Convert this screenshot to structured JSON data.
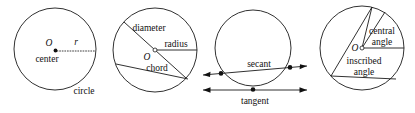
{
  "figure": {
    "stroke_color": "#1a1a1a",
    "background_color": "#ffffff",
    "text_color": "#111111"
  },
  "panels": [
    {
      "id": "panel-center-radius",
      "center_point_label": "O",
      "radius_variable": "r",
      "labels": {
        "center": "center",
        "circle": "circle"
      }
    },
    {
      "id": "panel-diameter-radius-chord",
      "center_point_label": "O",
      "labels": {
        "diameter": "diameter",
        "radius": "radius",
        "chord": "chord"
      }
    },
    {
      "id": "panel-secant-tangent",
      "labels": {
        "secant": "secant",
        "tangent": "tangent"
      }
    },
    {
      "id": "panel-angles",
      "center_point_label": "O",
      "labels": {
        "central_angle_line1": "central",
        "central_angle_line2": "angle",
        "inscribed_angle_line1": "inscribed",
        "inscribed_angle_line2": "angle"
      }
    }
  ]
}
